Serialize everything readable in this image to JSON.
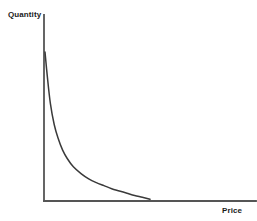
{
  "figure": {
    "background_color": "#ffffff",
    "axis_color": "#555555",
    "curve_color": "#3a3a3a"
  },
  "labels": {
    "y_axis_title": "Quantity",
    "x_axis_title": "Price"
  },
  "chart_data": {
    "type": "line",
    "title": "",
    "xlabel": "Price",
    "ylabel": "Quantity",
    "grid": false,
    "legend": "none",
    "annotations": [],
    "xlim": [
      0,
      10
    ],
    "ylim": [
      0,
      10
    ],
    "x_tick_labels": [],
    "y_tick_labels": [],
    "series": [
      {
        "name": "Demand",
        "color": "#3a3a3a",
        "x": [
          0.15,
          0.3,
          0.5,
          0.75,
          1.0,
          1.3,
          1.6,
          2.0,
          2.5,
          3.0,
          3.5,
          4.0,
          4.5,
          5.0,
          5.5,
          6.0,
          6.5,
          7.0
        ],
        "y": [
          9.8,
          8.2,
          6.4,
          5.0,
          4.1,
          3.3,
          2.75,
          2.2,
          1.75,
          1.4,
          1.15,
          0.95,
          0.75,
          0.6,
          0.45,
          0.3,
          0.18,
          0.05
        ]
      }
    ]
  },
  "geometry": {
    "origin_x": 44,
    "origin_y": 201,
    "y_axis_top": 15,
    "x_axis_right": 256,
    "curve_start": [
      45,
      52
    ],
    "curve_end": [
      150,
      200
    ]
  }
}
